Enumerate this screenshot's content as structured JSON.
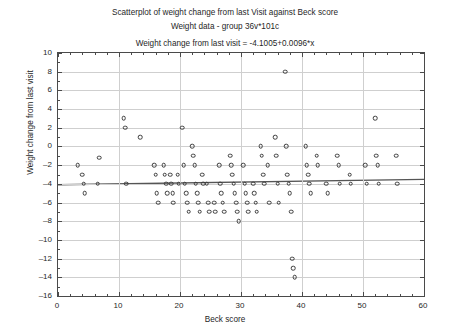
{
  "titles": {
    "line1": "Scatterplot of weight change from last Visit against Beck score",
    "line2": "Weight data - group 36v*101c",
    "line3": "Weight change from last visit = -4.1005+0.0096*x"
  },
  "chart_data": {
    "type": "scatter",
    "title": "Scatterplot of weight change from last Visit against Beck score",
    "subtitle": "Weight data - group 36v*101c",
    "annotation": "Weight change from last visit = -4.1005+0.0096*x",
    "xlabel": "Beck score",
    "ylabel": "Weight change from last visit",
    "xlim": [
      0,
      60
    ],
    "ylim": [
      -16,
      10
    ],
    "xticks": [
      0,
      10,
      20,
      30,
      40,
      50,
      60
    ],
    "yticks": [
      10,
      8,
      6,
      4,
      2,
      0,
      -2,
      -4,
      -6,
      -8,
      -10,
      -12,
      -14,
      -16
    ],
    "grid": true,
    "legend": false,
    "marker": "open-circle",
    "marker_color": "#3c3c3c",
    "fit_line": {
      "intercept": -4.1005,
      "slope": 0.0096,
      "color": "#555555"
    },
    "points": [
      [
        3.2,
        -2.0
      ],
      [
        4.0,
        -3.0
      ],
      [
        4.2,
        -4.0
      ],
      [
        4.4,
        -5.0
      ],
      [
        6.5,
        -4.0
      ],
      [
        6.8,
        -1.2
      ],
      [
        10.8,
        3.0
      ],
      [
        11.0,
        2.0
      ],
      [
        11.2,
        -4.0
      ],
      [
        13.5,
        1.0
      ],
      [
        15.8,
        -2.0
      ],
      [
        16.0,
        -3.0
      ],
      [
        16.2,
        -5.0
      ],
      [
        16.4,
        -6.0
      ],
      [
        17.3,
        -2.0
      ],
      [
        17.5,
        -3.0
      ],
      [
        17.7,
        -4.0
      ],
      [
        17.9,
        -5.0
      ],
      [
        18.4,
        -3.0
      ],
      [
        18.6,
        -4.0
      ],
      [
        18.8,
        -5.0
      ],
      [
        18.9,
        -6.0
      ],
      [
        19.6,
        -3.0
      ],
      [
        19.8,
        -4.0
      ],
      [
        20.4,
        2.0
      ],
      [
        20.6,
        -2.0
      ],
      [
        20.8,
        -4.0
      ],
      [
        21.0,
        -5.0
      ],
      [
        21.2,
        -6.0
      ],
      [
        21.4,
        -7.0
      ],
      [
        22.0,
        0.0
      ],
      [
        22.2,
        -1.0
      ],
      [
        22.4,
        -2.0
      ],
      [
        22.6,
        -4.0
      ],
      [
        22.8,
        -5.0
      ],
      [
        23.0,
        -6.0
      ],
      [
        23.2,
        -7.0
      ],
      [
        23.6,
        -3.0
      ],
      [
        23.8,
        -4.0
      ],
      [
        24.4,
        -4.0
      ],
      [
        24.6,
        -6.0
      ],
      [
        24.8,
        -7.0
      ],
      [
        25.6,
        -6.0
      ],
      [
        25.8,
        -7.0
      ],
      [
        26.4,
        -2.0
      ],
      [
        26.6,
        -4.0
      ],
      [
        26.8,
        -5.0
      ],
      [
        27.0,
        -6.0
      ],
      [
        27.2,
        -7.0
      ],
      [
        28.2,
        -1.0
      ],
      [
        28.4,
        -2.0
      ],
      [
        28.6,
        -3.0
      ],
      [
        28.8,
        -4.0
      ],
      [
        29.0,
        -5.0
      ],
      [
        29.2,
        -6.0
      ],
      [
        29.4,
        -7.0
      ],
      [
        29.6,
        -8.0
      ],
      [
        30.4,
        -2.0
      ],
      [
        30.6,
        -4.0
      ],
      [
        30.8,
        -5.0
      ],
      [
        31.0,
        -6.0
      ],
      [
        31.2,
        -7.0
      ],
      [
        32.0,
        -4.0
      ],
      [
        32.2,
        -5.0
      ],
      [
        32.4,
        -6.0
      ],
      [
        32.6,
        -7.0
      ],
      [
        33.2,
        0.0
      ],
      [
        33.4,
        -1.0
      ],
      [
        33.6,
        -3.0
      ],
      [
        33.8,
        -4.0
      ],
      [
        34.4,
        -2.0
      ],
      [
        34.6,
        -6.0
      ],
      [
        35.6,
        1.0
      ],
      [
        35.8,
        -1.0
      ],
      [
        36.0,
        -4.0
      ],
      [
        36.2,
        -6.0
      ],
      [
        37.2,
        8.0
      ],
      [
        37.4,
        0.0
      ],
      [
        37.6,
        -3.0
      ],
      [
        37.8,
        -4.0
      ],
      [
        38.0,
        -5.0
      ],
      [
        38.2,
        -7.0
      ],
      [
        38.4,
        -12.0
      ],
      [
        38.6,
        -13.0
      ],
      [
        38.8,
        -14.0
      ],
      [
        40.6,
        0.0
      ],
      [
        40.8,
        -2.0
      ],
      [
        41.0,
        -3.0
      ],
      [
        41.2,
        -4.0
      ],
      [
        41.4,
        -5.0
      ],
      [
        42.4,
        -1.0
      ],
      [
        42.6,
        -2.0
      ],
      [
        44.0,
        -4.0
      ],
      [
        44.2,
        -5.0
      ],
      [
        45.8,
        -1.0
      ],
      [
        46.0,
        -2.0
      ],
      [
        46.2,
        -4.0
      ],
      [
        47.8,
        -3.0
      ],
      [
        48.0,
        -4.0
      ],
      [
        50.4,
        -2.0
      ],
      [
        50.6,
        -4.0
      ],
      [
        52.0,
        3.0
      ],
      [
        52.2,
        -1.0
      ],
      [
        52.4,
        -2.0
      ],
      [
        52.6,
        -4.0
      ],
      [
        55.4,
        -1.0
      ],
      [
        55.6,
        -4.0
      ]
    ]
  }
}
